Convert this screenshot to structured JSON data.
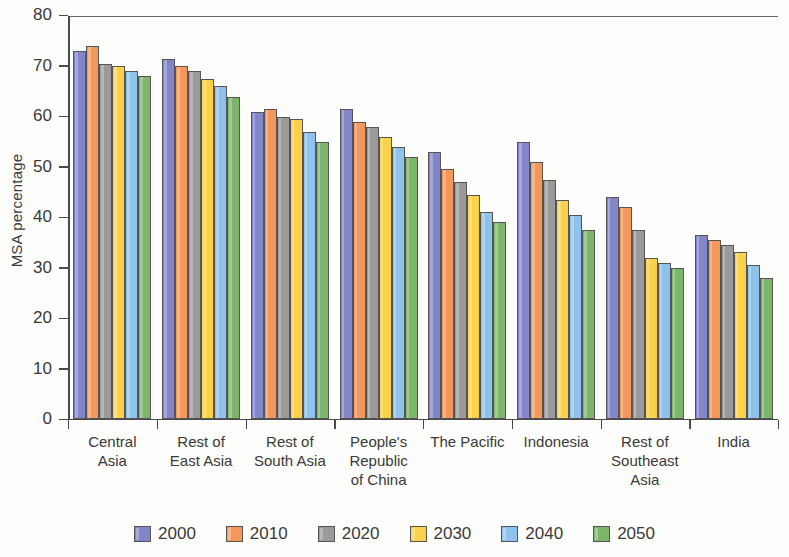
{
  "chart_data": {
    "type": "bar",
    "title": "",
    "xlabel": "",
    "ylabel": "MSA percentage",
    "ylim": [
      0,
      80
    ],
    "yticks": [
      0,
      10,
      20,
      30,
      40,
      50,
      60,
      70,
      80
    ],
    "grid": false,
    "legend_position": "bottom",
    "categories": [
      "Central Asia",
      "Rest of East Asia",
      "Rest of South Asia",
      "People's Republic of China",
      "The Pacific",
      "Indonesia",
      "Rest of Southeast Asia",
      "India"
    ],
    "category_lines": [
      [
        "Central",
        "Asia"
      ],
      [
        "Rest of",
        "East Asia"
      ],
      [
        "Rest of",
        "South Asia"
      ],
      [
        "People's",
        "Republic",
        "of China"
      ],
      [
        "The Pacific"
      ],
      [
        "Indonesia"
      ],
      [
        "Rest of",
        "Southeast",
        "Asia"
      ],
      [
        "India"
      ]
    ],
    "series": [
      {
        "name": "2000",
        "color": "#8186c8",
        "values": [
          73.0,
          71.5,
          61.0,
          61.5,
          53.0,
          55.0,
          44.0,
          36.5
        ]
      },
      {
        "name": "2010",
        "color": "#f4975c",
        "values": [
          74.0,
          70.0,
          61.5,
          59.0,
          49.5,
          51.0,
          42.0,
          35.5
        ]
      },
      {
        "name": "2020",
        "color": "#9a9a9a",
        "values": [
          70.5,
          69.0,
          60.0,
          58.0,
          47.0,
          47.5,
          37.5,
          34.5
        ]
      },
      {
        "name": "2030",
        "color": "#fbd14b",
        "values": [
          70.0,
          67.5,
          59.5,
          56.0,
          44.5,
          43.5,
          32.0,
          33.0
        ]
      },
      {
        "name": "2040",
        "color": "#8fc2ea",
        "values": [
          69.0,
          66.0,
          57.0,
          54.0,
          41.0,
          40.5,
          31.0,
          30.5
        ]
      },
      {
        "name": "2050",
        "color": "#7db56b",
        "values": [
          68.0,
          64.0,
          55.0,
          52.0,
          39.0,
          37.5,
          30.0,
          28.0
        ]
      }
    ]
  }
}
